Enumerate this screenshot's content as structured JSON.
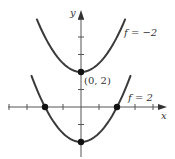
{
  "chart_data": {
    "type": "line",
    "title": "",
    "xlabel": "x",
    "ylabel": "y",
    "xlim": [
      -4,
      4.5
    ],
    "ylim": [
      -2.9,
      5.2
    ],
    "grid": false,
    "legend": "none",
    "series": [
      {
        "name": "f = -2",
        "label": "f = −2",
        "equation": "y = x^2/2 + 2",
        "x": [
          -2.45,
          -2,
          -1.5,
          -1,
          -0.5,
          0,
          0.5,
          1,
          1.5,
          2,
          2.45
        ],
        "values": [
          5.0,
          4.0,
          3.125,
          2.5,
          2.125,
          2.0,
          2.125,
          2.5,
          3.125,
          4.0,
          5.0
        ]
      },
      {
        "name": "f = 2",
        "label": "f = 2",
        "equation": "y = x^2/2 - 2",
        "x": [
          -2.75,
          -2,
          -1.5,
          -1,
          -0.5,
          0,
          0.5,
          1,
          1.5,
          2,
          2.75
        ],
        "values": [
          1.78,
          0.0,
          -0.875,
          -1.5,
          -1.875,
          -2.0,
          -1.875,
          -1.5,
          -0.875,
          0.0,
          1.78
        ]
      }
    ],
    "marked_points": [
      {
        "x": 0,
        "y": 2,
        "label": "(0, 2)"
      },
      {
        "x": -2,
        "y": 0,
        "label": ""
      },
      {
        "x": 2,
        "y": 0,
        "label": ""
      },
      {
        "x": 0,
        "y": -2,
        "label": ""
      }
    ],
    "annotations": [
      {
        "text": "f = −2",
        "near": "upper-right of top curve"
      },
      {
        "text": "f = 2",
        "near": "upper-right of bottom curve"
      },
      {
        "text": "(0, 2)",
        "near": "vertex of top curve"
      }
    ],
    "x_ticks": [
      -4,
      -3,
      -2,
      -1,
      1,
      2,
      3,
      4
    ],
    "y_ticks": [
      -2,
      -1,
      1,
      2,
      3,
      4,
      5
    ]
  },
  "labels": {
    "x_axis": "x",
    "y_axis": "y",
    "vertex": "(0, 2)",
    "curve_top": "f = −2",
    "curve_bottom": "f = 2"
  }
}
